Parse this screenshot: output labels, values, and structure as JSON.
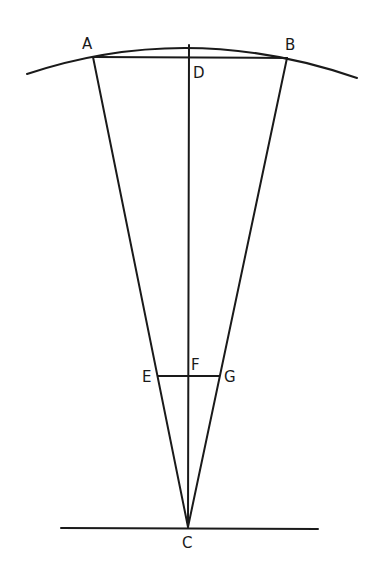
{
  "diagram": {
    "type": "geometric construction",
    "colors": {
      "ink": "#1a1a1a",
      "background": "#ffffff"
    },
    "points": {
      "A": {
        "label": "A",
        "x": 93,
        "y": 57
      },
      "B": {
        "label": "B",
        "x": 287,
        "y": 58
      },
      "C": {
        "label": "C",
        "x": 188,
        "y": 527
      },
      "D": {
        "label": "D",
        "x": 189,
        "y": 58
      },
      "E": {
        "label": "E",
        "x": 158,
        "y": 376
      },
      "F": {
        "label": "F",
        "x": 188,
        "y": 376
      },
      "G": {
        "label": "G",
        "x": 219,
        "y": 376
      }
    },
    "segments": [
      "AB",
      "AC",
      "BC",
      "DC",
      "EG"
    ],
    "arc": {
      "from": [
        27,
        74
      ],
      "peak": [
        189,
        46
      ],
      "to": [
        357,
        78
      ]
    },
    "baseline": {
      "from": [
        61,
        528
      ],
      "to": [
        318,
        529
      ]
    }
  }
}
